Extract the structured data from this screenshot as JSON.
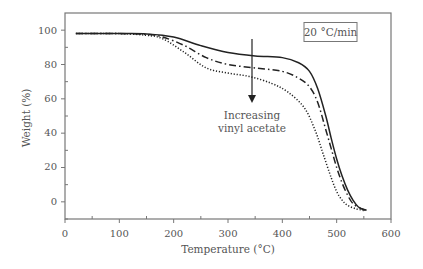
{
  "chart_data": {
    "type": "line",
    "title": "",
    "xlabel": "Temperature (°C)",
    "ylabel": "Weight (%)",
    "xlim": [
      0,
      600
    ],
    "ylim": [
      -10,
      110
    ],
    "x_ticks": [
      0,
      100,
      200,
      300,
      400,
      500,
      600
    ],
    "y_ticks": [
      0,
      20,
      40,
      60,
      80,
      100
    ],
    "grid": false,
    "legend": null,
    "series": [
      {
        "name": "Lowest vinyl acetate",
        "style": "solid",
        "x": [
          20,
          100,
          150,
          200,
          250,
          300,
          350,
          400,
          430,
          450,
          465,
          480,
          490,
          500,
          510,
          520,
          530,
          540,
          555
        ],
        "y": [
          98,
          98,
          97.8,
          96,
          91,
          87,
          85,
          84,
          81,
          76,
          66,
          50,
          37,
          25,
          15,
          7,
          1,
          -3,
          -5
        ]
      },
      {
        "name": "Intermediate vinyl acetate",
        "style": "dash-dot",
        "x": [
          20,
          100,
          150,
          180,
          220,
          260,
          300,
          350,
          400,
          430,
          450,
          465,
          480,
          490,
          500,
          510,
          520,
          530,
          545,
          555
        ],
        "y": [
          98,
          98,
          97.5,
          96,
          91,
          84,
          80,
          78,
          76,
          72,
          67,
          58,
          42,
          31,
          20,
          11,
          4,
          -1,
          -4,
          -5
        ]
      },
      {
        "name": "Highest vinyl acetate",
        "style": "dotted",
        "x": [
          20,
          100,
          150,
          180,
          220,
          260,
          300,
          340,
          380,
          410,
          440,
          460,
          475,
          490,
          500,
          510,
          520,
          535,
          550
        ],
        "y": [
          98,
          98,
          97,
          95,
          87,
          78,
          75,
          73,
          69,
          64,
          55,
          42,
          28,
          14,
          6,
          1,
          -2,
          -4,
          -5
        ]
      }
    ],
    "annotations": [
      {
        "text_lines": [
          "Increasing",
          "vinyl acetate"
        ],
        "arrow": {
          "x": 345,
          "y_from": 106,
          "y_to": 58,
          "direction": "down"
        }
      },
      {
        "text": "20 °C/min",
        "boxed": true
      }
    ]
  },
  "labels": {
    "xlabel": "Temperature (°C)",
    "ylabel": "Weight (%)",
    "rate_box": "20 °C/min",
    "arrow_line1": "Increasing",
    "arrow_line2": "vinyl acetate",
    "x_ticks": [
      "0",
      "100",
      "200",
      "300",
      "400",
      "500",
      "600"
    ],
    "y_ticks": [
      "0",
      "20",
      "40",
      "60",
      "80",
      "100"
    ]
  }
}
